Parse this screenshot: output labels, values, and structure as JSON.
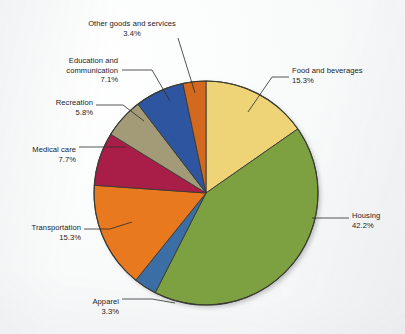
{
  "figure": {
    "background_color": "#f6f7f8",
    "pie_outline_color": "#3a3a32",
    "pie_center_x": 206,
    "pie_center_y": 193,
    "pie_radius": 112
  },
  "chart_data": {
    "type": "pie",
    "title": "",
    "subtitle": "",
    "xlabel": "",
    "ylabel": "",
    "grid": false,
    "legend_position": "none",
    "label_format": "name + percent, external with leader lines",
    "start_angle_deg": 0,
    "direction": "clockwise",
    "units": "percent",
    "total": 100.1,
    "categories": [
      "Food and beverages",
      "Housing",
      "Apparel",
      "Transportation",
      "Medical care",
      "Recreation",
      "Education and communication",
      "Other goods and services"
    ],
    "values": [
      15.3,
      42.2,
      3.3,
      15.3,
      7.7,
      5.8,
      7.1,
      3.4
    ],
    "colors": [
      "#efd477",
      "#7da141",
      "#3a6ea5",
      "#e8791f",
      "#a81e48",
      "#a39b77",
      "#2d55a0",
      "#d2691e"
    ],
    "slices": [
      {
        "name": "Food and beverages",
        "value": 15.3,
        "value_text": "15.3%",
        "color": "#efd477",
        "start_deg": 0,
        "end_deg": 55.08,
        "label_anchor": "left",
        "label_x": 292,
        "label_y": 66
      },
      {
        "name": "Housing",
        "value": 42.2,
        "value_text": "42.2%",
        "color": "#7da141",
        "start_deg": 55.08,
        "end_deg": 206.99,
        "label_anchor": "left",
        "label_x": 352,
        "label_y": 211
      },
      {
        "name": "Apparel",
        "value": 3.3,
        "value_text": "3.3%",
        "color": "#3a6ea5",
        "start_deg": 206.99,
        "end_deg": 218.87,
        "label_anchor": "right",
        "label_x": 119,
        "label_y": 297
      },
      {
        "name": "Transportation",
        "value": 15.3,
        "value_text": "15.3%",
        "color": "#e8791f",
        "start_deg": 218.87,
        "end_deg": 273.95,
        "label_anchor": "right",
        "label_x": 81,
        "label_y": 223
      },
      {
        "name": "Medical care",
        "value": 7.7,
        "value_text": "7.7%",
        "color": "#a81e48",
        "start_deg": 273.95,
        "end_deg": 301.67,
        "label_anchor": "right",
        "label_x": 76,
        "label_y": 145
      },
      {
        "name": "Recreation",
        "value": 5.8,
        "value_text": "5.8%",
        "color": "#a39b77",
        "start_deg": 301.67,
        "end_deg": 322.55,
        "label_anchor": "right",
        "label_x": 93,
        "label_y": 98
      },
      {
        "name": "Education and communication",
        "value": 7.1,
        "value_text": "7.1%",
        "color": "#2d55a0",
        "start_deg": 322.55,
        "end_deg": 348.11,
        "label_anchor": "right",
        "label_x": 118,
        "label_y": 56
      },
      {
        "name": "Other goods and services",
        "value": 3.4,
        "value_text": "3.4%",
        "color": "#d2691e",
        "start_deg": 348.11,
        "end_deg": 360,
        "label_anchor": "center",
        "label_x": 132,
        "label_y": 19
      }
    ],
    "leader_lines": [
      {
        "name": "Food and beverages",
        "x1": 248,
        "y1": 112,
        "x2": 272,
        "y2": 77,
        "x3": 289,
        "y3": 77
      },
      {
        "name": "Housing",
        "x1": 312,
        "y1": 218,
        "x2": 330,
        "y2": 218,
        "x3": 349,
        "y3": 218
      },
      {
        "name": "Apparel",
        "x1": 175,
        "y1": 303,
        "x2": 152,
        "y2": 299,
        "x3": 122,
        "y3": 299
      },
      {
        "name": "Transportation",
        "x1": 132,
        "y1": 222,
        "x2": 110,
        "y2": 229,
        "x3": 84,
        "y3": 229
      },
      {
        "name": "Medical care",
        "x1": 126,
        "y1": 147,
        "x2": 107,
        "y2": 147,
        "x3": 79,
        "y3": 147
      },
      {
        "name": "Recreation",
        "x1": 144,
        "y1": 121,
        "x2": 123,
        "y2": 105,
        "x3": 96,
        "y3": 105
      },
      {
        "name": "Education and communication",
        "x1": 170,
        "y1": 101,
        "x2": 152,
        "y2": 70,
        "x3": 122,
        "y3": 70
      },
      {
        "name": "Other goods and services",
        "x1": 195,
        "y1": 93,
        "x2": 178,
        "y2": 38,
        "x3": 178,
        "y3": 38
      }
    ]
  }
}
